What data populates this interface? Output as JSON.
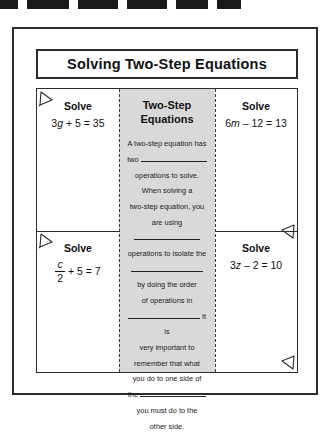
{
  "top_strip": {
    "name": "cut-edge-strip",
    "dashes": [
      {
        "width": 18,
        "offset": 0
      },
      {
        "width": 42,
        "offset": 9
      },
      {
        "width": 40,
        "offset": 9
      },
      {
        "width": 40,
        "offset": 9
      },
      {
        "width": 32,
        "offset": 9
      },
      {
        "width": 24,
        "offset": 9
      }
    ]
  },
  "worksheet": {
    "title": "Solving Two-Step Equations",
    "cells": {
      "top_left": {
        "label": "Solve",
        "equation_coef": "3",
        "equation_var": "g",
        "equation_rest": "+ 5 = 35",
        "equation_full": "3g + 5 = 35"
      },
      "top_right": {
        "label": "Solve",
        "equation_coef": "6",
        "equation_var": "m",
        "equation_rest": "– 12 = 13",
        "equation_full": "6m – 12 = 13"
      },
      "bottom_left": {
        "label": "Solve",
        "fraction_numerator": "c",
        "fraction_denominator": "2",
        "equation_rest": "+ 5 = 7",
        "equation_full": "c/2 + 5 = 7"
      },
      "bottom_right": {
        "label": "Solve",
        "equation_coef": "3",
        "equation_var": "z",
        "equation_rest": "– 2 = 10",
        "equation_full": "3z – 2 = 10"
      }
    },
    "center_flap": {
      "title_line1": "Two-Step",
      "title_line2": "Equations",
      "body_lines": [
        {
          "text_before": "A two-step equation has",
          "blank": false
        },
        {
          "text_before": "two",
          "blank": true,
          "blank_size": "lg",
          "text_after": ""
        },
        {
          "text_before": "operations to solve.",
          "blank": false
        },
        {
          "text_before": "When solving a",
          "blank": false
        },
        {
          "text_before": "two-step equation, you",
          "blank": false
        },
        {
          "text_before": "are using",
          "blank": true,
          "blank_size": "lg",
          "text_after": ""
        },
        {
          "text_before": "operations to isolate the",
          "blank": false
        },
        {
          "text_before": "",
          "blank": true,
          "blank_size": "xl",
          "text_after": ""
        },
        {
          "text_before": "by doing the order",
          "blank": false
        },
        {
          "text_before": "of operations in",
          "blank": false
        },
        {
          "text_before": "",
          "blank": true,
          "blank_size": "xl",
          "text_after": "It is"
        },
        {
          "text_before": "very important to",
          "blank": false
        },
        {
          "text_before": "remember that what",
          "blank": false
        },
        {
          "text_before": "you do to one side of",
          "blank": false
        },
        {
          "text_before": "the",
          "blank": true,
          "blank_size": "lg",
          "text_after": ""
        },
        {
          "text_before": "you must do to the",
          "blank": false
        },
        {
          "text_before": "other side.",
          "blank": false
        }
      ]
    },
    "fold_markers": [
      {
        "name": "fold-corner-top-left-upper",
        "position": "top-left"
      },
      {
        "name": "fold-corner-top-left-lower",
        "position": "top-left"
      },
      {
        "name": "fold-corner-right-middle",
        "position": "top-right"
      },
      {
        "name": "fold-corner-bottom-right",
        "position": "bottom-right"
      }
    ]
  },
  "colors": {
    "ink": "#2b2b2b",
    "flap_background": "#d9d9d9",
    "paper": "#ffffff"
  }
}
